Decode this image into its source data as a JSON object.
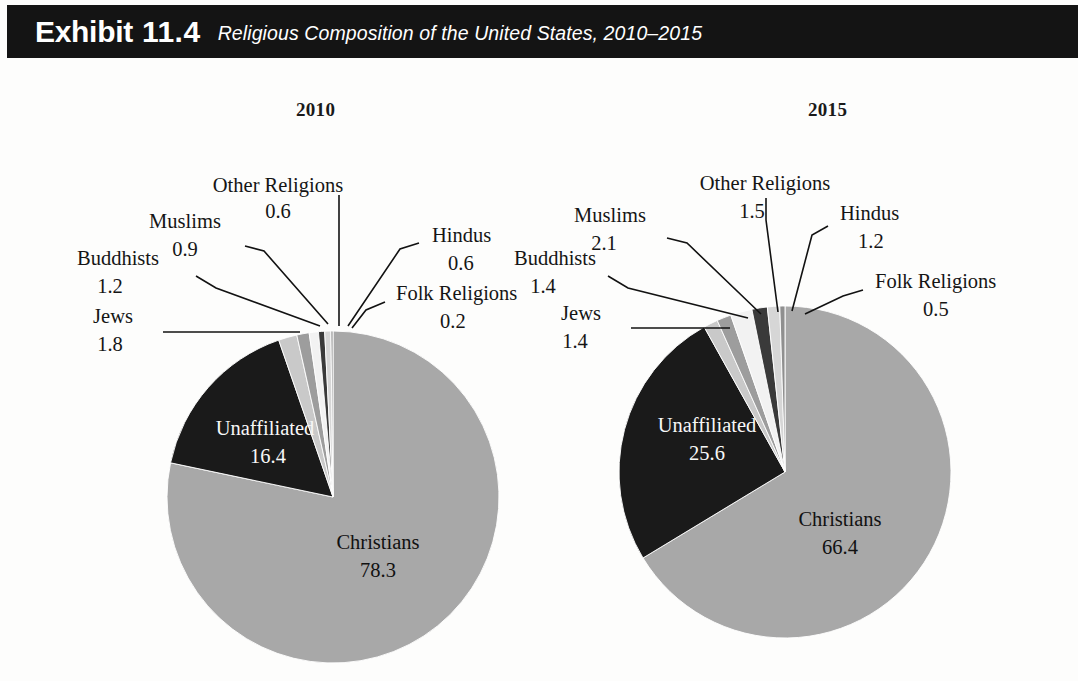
{
  "header": {
    "exhibit_label": "Exhibit",
    "exhibit_number": "11.4",
    "subtitle": "Religious Composition of the United States, 2010–2015",
    "band_color": "#141414",
    "text_color": "#ffffff"
  },
  "page": {
    "background": "#fdfdfc"
  },
  "palette": {
    "christians": "#a8a8a8",
    "unaffiliated": "#1a1a1a",
    "jews": "#c9c9c9",
    "buddhists": "#9d9d9d",
    "muslims": "#f2f2f2",
    "other_religions": "#3a3a3a",
    "hindus": "#d6d6d6",
    "folk_religions": "#8f8f8f",
    "outline": "#121212"
  },
  "chart_data": [
    {
      "type": "pie",
      "title": "2010",
      "unit": "percent",
      "categories": [
        "Christians",
        "Unaffiliated",
        "Jews",
        "Buddhists",
        "Muslims",
        "Other Religions",
        "Hindus",
        "Folk Religions"
      ],
      "values": [
        78.3,
        16.4,
        1.8,
        1.2,
        0.9,
        0.6,
        0.6,
        0.2
      ],
      "labels": {
        "christians_name": "Christians",
        "christians_value": "78.3",
        "unaffiliated_name": "Unaffiliated",
        "unaffiliated_value": "16.4",
        "jews_name": "Jews",
        "jews_value": "1.8",
        "buddhists_name": "Buddhists",
        "buddhists_value": "1.2",
        "muslims_name": "Muslims",
        "muslims_value": "0.9",
        "other_name": "Other Religions",
        "other_value": "0.6",
        "hindus_name": "Hindus",
        "hindus_value": "0.6",
        "folk_name": "Folk Religions",
        "folk_value": "0.2"
      }
    },
    {
      "type": "pie",
      "title": "2015",
      "unit": "percent",
      "categories": [
        "Christians",
        "Unaffiliated",
        "Muslims",
        "Other Religions",
        "Buddhists",
        "Jews",
        "Hindus",
        "Folk Religions"
      ],
      "values": [
        66.4,
        25.6,
        2.1,
        1.5,
        1.4,
        1.4,
        1.2,
        0.5
      ],
      "labels": {
        "christians_name": "Christians",
        "christians_value": "66.4",
        "unaffiliated_name": "Unaffiliated",
        "unaffiliated_value": "25.6",
        "jews_name": "Jews",
        "jews_value": "1.4",
        "buddhists_name": "Buddhists",
        "buddhists_value": "1.4",
        "muslims_name": "Muslims",
        "muslims_value": "2.1",
        "other_name": "Other Religions",
        "other_value": "1.5",
        "hindus_name": "Hindus",
        "hindus_value": "1.2",
        "folk_name": "Folk Religions",
        "folk_value": "0.5"
      }
    }
  ]
}
